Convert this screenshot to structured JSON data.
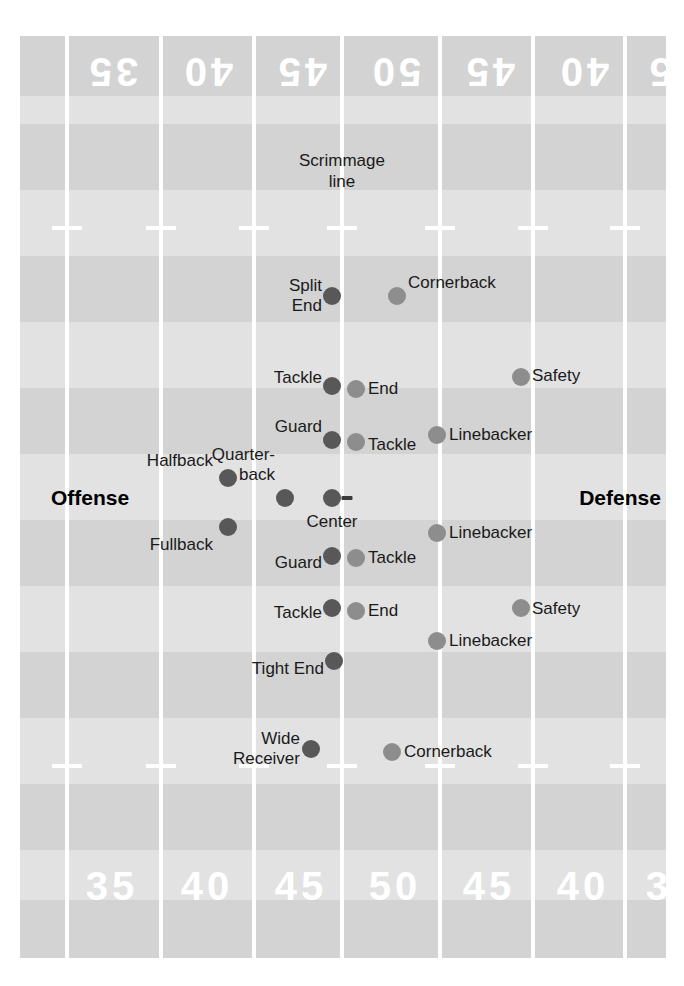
{
  "diagram": {
    "scrimmage_label": "Scrimmage\nline",
    "offense_label": "Offense",
    "defense_label": "Defense",
    "ball_marker": "football"
  },
  "colors": {
    "field": "#d9d9d9",
    "band_dark": "#d3d3d3",
    "band_light": "#e2e2e2",
    "yard_line": "#ffffff",
    "offense_dot": "#585858",
    "defense_dot": "#8d8d8d",
    "label_text": "#1a1a1a",
    "yard_number": "#ffffff"
  },
  "yard_numbers_top": [
    {
      "text": "35",
      "x": 112
    },
    {
      "text": "40",
      "x": 207
    },
    {
      "text": "45",
      "x": 301
    },
    {
      "text": "50",
      "x": 395
    },
    {
      "text": "45",
      "x": 489
    },
    {
      "text": "40",
      "x": 583
    },
    {
      "text": "35",
      "x": 672
    }
  ],
  "yard_numbers_bottom": [
    {
      "text": "35",
      "x": 112
    },
    {
      "text": "40",
      "x": 207
    },
    {
      "text": "45",
      "x": 301
    },
    {
      "text": "50",
      "x": 395
    },
    {
      "text": "45",
      "x": 489
    },
    {
      "text": "40",
      "x": 583
    },
    {
      "text": "35",
      "x": 672
    }
  ],
  "yard_lines_x": [
    67,
    161,
    254,
    342,
    440,
    533,
    625
  ],
  "hash_rows_y": [
    228,
    766
  ],
  "bands": [
    {
      "y": 0,
      "h": 60,
      "tone": "dark"
    },
    {
      "y": 60,
      "h": 28,
      "tone": "light"
    },
    {
      "y": 88,
      "h": 66,
      "tone": "dark"
    },
    {
      "y": 154,
      "h": 66,
      "tone": "light"
    },
    {
      "y": 220,
      "h": 66,
      "tone": "dark"
    },
    {
      "y": 286,
      "h": 66,
      "tone": "light"
    },
    {
      "y": 352,
      "h": 66,
      "tone": "dark"
    },
    {
      "y": 418,
      "h": 66,
      "tone": "light"
    },
    {
      "y": 484,
      "h": 66,
      "tone": "dark"
    },
    {
      "y": 550,
      "h": 66,
      "tone": "light"
    },
    {
      "y": 616,
      "h": 66,
      "tone": "dark"
    },
    {
      "y": 682,
      "h": 66,
      "tone": "light"
    },
    {
      "y": 748,
      "h": 66,
      "tone": "dark"
    },
    {
      "y": 814,
      "h": 50,
      "tone": "light"
    },
    {
      "y": 864,
      "h": 58,
      "tone": "dark"
    }
  ],
  "scrimmage": {
    "x": 342,
    "y": 150
  },
  "side_labels": {
    "offense": {
      "text": "Offense",
      "x": 90,
      "y": 498
    },
    "defense": {
      "text": "Defense",
      "x": 620,
      "y": 498
    }
  },
  "ball": {
    "x": 347,
    "y": 498
  },
  "players": [
    {
      "name": "Split End",
      "label": "Split\nEnd",
      "team": "offense",
      "x": 332,
      "y": 296,
      "label_side": "left",
      "label_x": 322,
      "label_y": 296
    },
    {
      "name": "Cornerback 1",
      "label": "Cornerback",
      "team": "defense",
      "x": 397,
      "y": 296,
      "label_side": "right",
      "label_x": 408,
      "label_y": 283
    },
    {
      "name": "Tackle upper",
      "label": "Tackle",
      "team": "offense",
      "x": 332,
      "y": 386,
      "label_side": "left",
      "label_x": 322,
      "label_y": 378
    },
    {
      "name": "End upper",
      "label": "End",
      "team": "defense",
      "x": 356,
      "y": 389,
      "label_side": "right",
      "label_x": 368,
      "label_y": 389
    },
    {
      "name": "Safety upper",
      "label": "Safety",
      "team": "defense",
      "x": 521,
      "y": 377,
      "label_side": "right",
      "label_x": 532,
      "label_y": 376
    },
    {
      "name": "Guard upper",
      "label": "Guard",
      "team": "offense",
      "x": 332,
      "y": 440,
      "label_side": "left",
      "label_x": 322,
      "label_y": 427
    },
    {
      "name": "Tackle def upper",
      "label": "Tackle",
      "team": "defense",
      "x": 356,
      "y": 442,
      "label_side": "right",
      "label_x": 368,
      "label_y": 445
    },
    {
      "name": "Linebacker upper",
      "label": "Linebacker",
      "team": "defense",
      "x": 437,
      "y": 435,
      "label_side": "right",
      "label_x": 449,
      "label_y": 435
    },
    {
      "name": "Halfback",
      "label": "Halfback",
      "team": "offense",
      "x": 228,
      "y": 478,
      "label_side": "left",
      "label_x": 213,
      "label_y": 461
    },
    {
      "name": "Quarterback",
      "label": "Quarter-\nback",
      "team": "offense",
      "x": 285,
      "y": 498,
      "label_side": "left",
      "label_x": 275,
      "label_y": 465
    },
    {
      "name": "Center",
      "label": "Center",
      "team": "offense",
      "x": 332,
      "y": 498,
      "label_side": "below",
      "label_x": 332,
      "label_y": 522
    },
    {
      "name": "Fullback",
      "label": "Fullback",
      "team": "offense",
      "x": 228,
      "y": 527,
      "label_side": "left",
      "label_x": 213,
      "label_y": 545
    },
    {
      "name": "Linebacker mid",
      "label": "Linebacker",
      "team": "defense",
      "x": 437,
      "y": 533,
      "label_side": "right",
      "label_x": 449,
      "label_y": 533
    },
    {
      "name": "Guard lower",
      "label": "Guard",
      "team": "offense",
      "x": 332,
      "y": 556,
      "label_side": "left",
      "label_x": 322,
      "label_y": 563
    },
    {
      "name": "Tackle def lower",
      "label": "Tackle",
      "team": "defense",
      "x": 356,
      "y": 558,
      "label_side": "right",
      "label_x": 368,
      "label_y": 558
    },
    {
      "name": "Tackle lower",
      "label": "Tackle",
      "team": "offense",
      "x": 332,
      "y": 608,
      "label_side": "left",
      "label_x": 322,
      "label_y": 613
    },
    {
      "name": "End lower",
      "label": "End",
      "team": "defense",
      "x": 356,
      "y": 611,
      "label_side": "right",
      "label_x": 368,
      "label_y": 611
    },
    {
      "name": "Safety lower",
      "label": "Safety",
      "team": "defense",
      "x": 521,
      "y": 608,
      "label_side": "right",
      "label_x": 532,
      "label_y": 609
    },
    {
      "name": "Linebacker lower",
      "label": "Linebacker",
      "team": "defense",
      "x": 437,
      "y": 641,
      "label_side": "right",
      "label_x": 449,
      "label_y": 641
    },
    {
      "name": "Tight End",
      "label": "Tight End",
      "team": "offense",
      "x": 334,
      "y": 661,
      "label_side": "left",
      "label_x": 324,
      "label_y": 669
    },
    {
      "name": "Wide Receiver",
      "label": "Wide\nReceiver",
      "team": "offense",
      "x": 311,
      "y": 749,
      "label_side": "left",
      "label_x": 300,
      "label_y": 749
    },
    {
      "name": "Cornerback 2",
      "label": "Cornerback",
      "team": "defense",
      "x": 392,
      "y": 752,
      "label_side": "right",
      "label_x": 404,
      "label_y": 752
    }
  ]
}
